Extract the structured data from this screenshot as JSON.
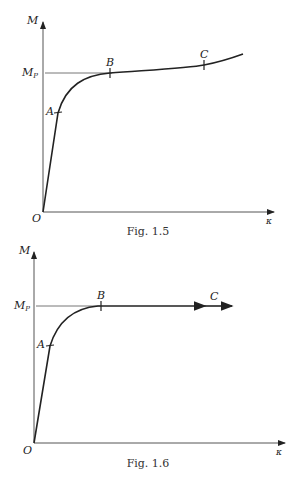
{
  "figures": [
    {
      "caption": "Fig. 1.5",
      "y_axis_label": "M",
      "x_axis_label": "κ",
      "origin_label": "O",
      "mp_label": "M",
      "mp_sub": "P",
      "points": {
        "A": "A",
        "B": "B",
        "C": "C"
      },
      "description": "Moment-curvature curve with strain hardening beyond M_P"
    },
    {
      "caption": "Fig. 1.6",
      "y_axis_label": "M",
      "x_axis_label": "κ",
      "origin_label": "O",
      "mp_label": "M",
      "mp_sub": "P",
      "points": {
        "A": "A",
        "B": "B",
        "C": "C"
      },
      "description": "Idealized moment-curvature curve, flat at M_P after B"
    }
  ],
  "colors": {
    "ink": "#222222",
    "guide": "#777777"
  }
}
